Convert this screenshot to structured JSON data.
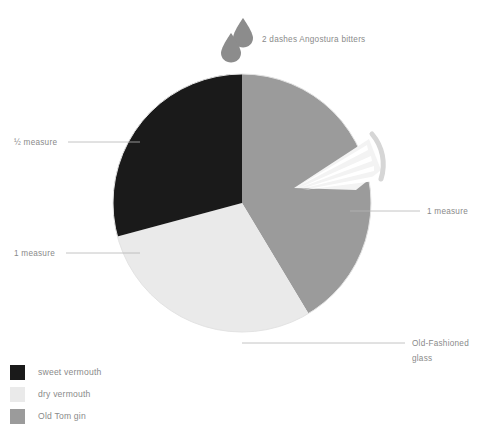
{
  "figure": {
    "background": "#ffffff"
  },
  "chart_data": {
    "type": "pie",
    "title": "",
    "center": [
      242,
      203
    ],
    "radius": 129,
    "start_angle_deg": 0,
    "direction": "clockwise",
    "categories": [
      "Old Tom gin",
      "dry vermouth",
      "sweet vermouth"
    ],
    "values": [
      1,
      1,
      0.5
    ],
    "value_labels": [
      "1 measure",
      "1 measure",
      "½ measure"
    ],
    "angles_deg": [
      149,
      106,
      105
    ],
    "colors": [
      "#9b9b9b",
      "#eaeaea",
      "#1a1a1a"
    ],
    "legend_position": "bottom-left",
    "grid": false
  },
  "annotations": {
    "bitters": {
      "text": "2 dashes Angostura bitters",
      "icon": "droplet-icon",
      "count": 2,
      "color": "#8c8c8c"
    },
    "callouts": [
      {
        "name": "sweet-vermouth-callout",
        "text": "½ measure",
        "side": "left"
      },
      {
        "name": "dry-vermouth-callout",
        "text": "1 measure",
        "side": "left"
      },
      {
        "name": "gin-callout",
        "text": "1 measure",
        "side": "right"
      },
      {
        "name": "glass-callout",
        "line1": "Old-Fashioned",
        "line2": "glass",
        "side": "right"
      }
    ],
    "garnish": {
      "name": "citrus-wedge-icon",
      "wedge_color": "#f2f2f2",
      "rind_color": "#d5d5d5"
    }
  },
  "legend": {
    "items": [
      {
        "label": "sweet vermouth",
        "color": "#1a1a1a"
      },
      {
        "label": "dry vermouth",
        "color": "#eaeaea"
      },
      {
        "label": "Old Tom gin",
        "color": "#9b9b9b"
      }
    ]
  },
  "colors": {
    "leader_line": "#b5b5b5",
    "text": "#8a8a8a",
    "dark": "#1a1a1a",
    "light": "#eaeaea",
    "mid": "#9b9b9b"
  }
}
